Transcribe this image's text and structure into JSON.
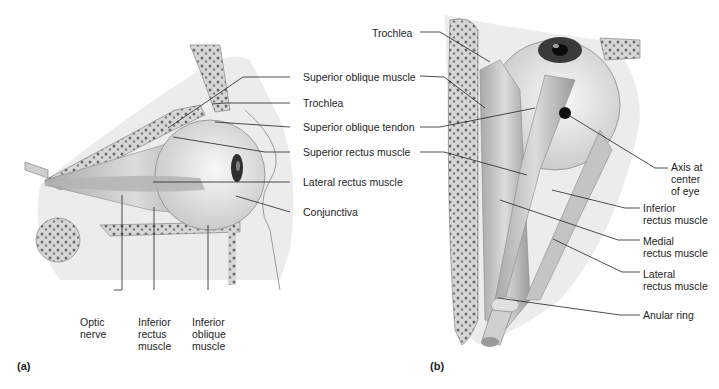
{
  "figure": {
    "panels": [
      {
        "id": "a",
        "label": "(a)",
        "view": "lateral view of right eye",
        "callouts": [
          {
            "text": "Superior oblique muscle"
          },
          {
            "text": "Trochlea"
          },
          {
            "text": "Superior oblique tendon"
          },
          {
            "text": "Superior rectus muscle"
          },
          {
            "text": "Lateral rectus muscle"
          },
          {
            "text": "Conjunctiva"
          },
          {
            "text": "Optic\nnerve"
          },
          {
            "text": "Inferior\nrectus\nmuscle"
          },
          {
            "text": "Inferior\noblique\nmuscle"
          }
        ]
      },
      {
        "id": "b",
        "label": "(b)",
        "view": "superior view of orbit",
        "callouts": [
          {
            "text": "Trochlea"
          },
          {
            "text": "Axis at\ncenter\nof eye"
          },
          {
            "text": "Inferior\nrectus muscle"
          },
          {
            "text": "Medial\nrectus muscle"
          },
          {
            "text": "Lateral\nrectus muscle"
          },
          {
            "text": "Anular ring"
          }
        ]
      }
    ],
    "colors": {
      "background": "#ffffff",
      "line": "#222222",
      "bone": "#d9d9d9",
      "bone_pores": "#6a6a6a",
      "muscle": "#bdbdbd",
      "muscle_dark": "#8c8c8c",
      "eyeball": "#eeeeee",
      "iris": "#3a3a3a",
      "pupil": "#0a0a0a"
    }
  }
}
